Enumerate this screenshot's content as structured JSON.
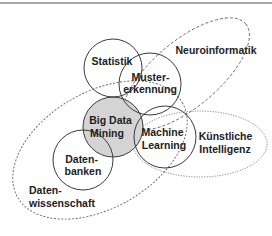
{
  "diagram": {
    "title": "",
    "colors": {
      "stroke": "#3a3a3a",
      "dashed_stroke": "#555555",
      "highlight_fill": "#d4d4d4",
      "border": "#a8a8a8"
    },
    "fields": [
      {
        "id": "statistik",
        "lines": [
          "Statistik"
        ],
        "style": "solid"
      },
      {
        "id": "mustererkennung",
        "lines": [
          "Muster-",
          "erkennung"
        ],
        "style": "solid"
      },
      {
        "id": "big-data-mining",
        "lines": [
          "Big Data",
          "Mining"
        ],
        "style": "solid-filled"
      },
      {
        "id": "datenbanken",
        "lines": [
          "Daten-",
          "banken"
        ],
        "style": "solid"
      },
      {
        "id": "machine-learning",
        "lines": [
          "Machine",
          "Learning"
        ],
        "style": "solid"
      },
      {
        "id": "neuroinformatik",
        "lines": [
          "Neuroinformatik"
        ],
        "style": "dashed"
      },
      {
        "id": "kuenstliche-intelligenz",
        "lines": [
          "Künstliche",
          "Intelligenz"
        ],
        "style": "dotted"
      },
      {
        "id": "datenwissenschaft",
        "lines": [
          "Daten-",
          "wissenschaft"
        ],
        "style": "dashed"
      }
    ]
  }
}
